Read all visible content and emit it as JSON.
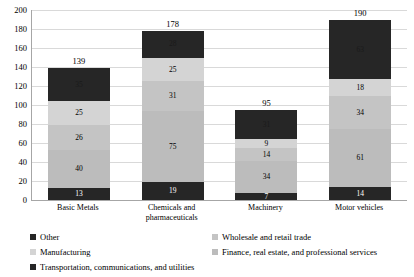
{
  "chart_data": {
    "type": "bar",
    "stacked": true,
    "title": "",
    "xlabel": "",
    "ylabel": "",
    "ylim": [
      0,
      200
    ],
    "ytick_step": 20,
    "yticks": [
      200,
      180,
      160,
      140,
      120,
      100,
      80,
      60,
      40,
      20,
      0
    ],
    "grid": true,
    "legend_position": "bottom",
    "categories": [
      "Basic Metals",
      "Chemicals and pharmaceuticals",
      "Machinery",
      "Motor vehicles"
    ],
    "totals": [
      139,
      178,
      95,
      190
    ],
    "series": [
      {
        "name": "Transportation, communications, and utilities",
        "color": "#262626",
        "label_color": "#ffffff",
        "values": [
          13,
          19,
          7,
          14
        ]
      },
      {
        "name": "Finance, real estate, and professional services",
        "color": "#bcbcbc",
        "label_color": "#000000",
        "values": [
          40,
          75,
          34,
          61
        ]
      },
      {
        "name": "Wholesale and retail trade",
        "color": "#c4c4c4",
        "label_color": "#000000",
        "values": [
          26,
          31,
          14,
          34
        ]
      },
      {
        "name": "Manufacturing",
        "color": "#d4d4d4",
        "label_color": "#000000",
        "values": [
          25,
          25,
          9,
          18
        ]
      },
      {
        "name": "Other",
        "color": "#262626",
        "label_color": "#1a1a1a",
        "values": [
          35,
          28,
          31,
          63
        ]
      }
    ],
    "legend_entries": [
      {
        "label": "Other",
        "color": "#262626"
      },
      {
        "label": "Wholesale and retail trade",
        "color": "#c4c4c4"
      },
      {
        "label": "Manufacturing",
        "color": "#d4d4d4"
      },
      {
        "label": "Finance, real estate, and professional services",
        "color": "#bcbcbc"
      },
      {
        "label": "Transportation, communications, and utilities",
        "color": "#262626"
      }
    ]
  }
}
